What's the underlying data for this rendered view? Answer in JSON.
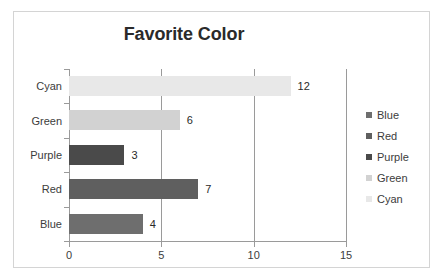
{
  "chart_data": {
    "type": "bar",
    "orientation": "horizontal",
    "title": "Favorite Color",
    "xlabel": "",
    "ylabel": "",
    "categories": [
      "Blue",
      "Red",
      "Purple",
      "Green",
      "Cyan"
    ],
    "values": [
      4,
      7,
      3,
      6,
      12
    ],
    "data_labels": [
      "4",
      "7",
      "3",
      "6",
      "12"
    ],
    "bar_colors": [
      "#6e6e6e",
      "#5f5f5f",
      "#4a4a4a",
      "#d2d2d2",
      "#e8e8e8"
    ],
    "xlim": [
      0,
      15
    ],
    "xticks": [
      0,
      5,
      10,
      15
    ],
    "xtick_labels": [
      "0",
      "5",
      "10",
      "15"
    ],
    "grid": "vertical",
    "legend": {
      "position": "right",
      "entries": [
        {
          "label": "Blue",
          "color": "#6e6e6e"
        },
        {
          "label": "Red",
          "color": "#5f5f5f"
        },
        {
          "label": "Purple",
          "color": "#4a4a4a"
        },
        {
          "label": "Green",
          "color": "#d2d2d2"
        },
        {
          "label": "Cyan",
          "color": "#e8e8e8"
        }
      ]
    },
    "display_order_top_to_bottom": [
      "Cyan",
      "Green",
      "Purple",
      "Red",
      "Blue"
    ]
  },
  "colors": {
    "border": "#d4d4d4",
    "axis": "#9a9a9a",
    "gridline": "#9a9a9a",
    "title_text": "#2a2a2a",
    "label_text": "#3c3c3c",
    "background": "#ffffff"
  }
}
